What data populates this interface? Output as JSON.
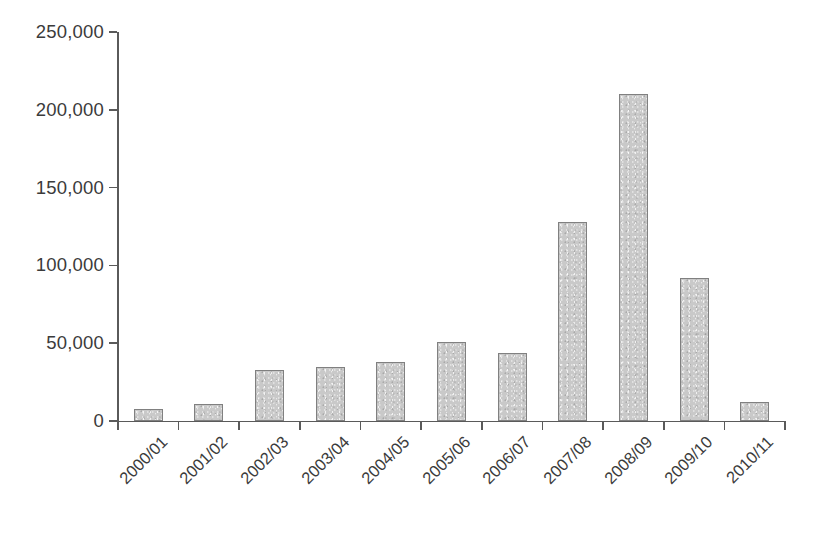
{
  "chart_data": {
    "type": "bar",
    "title": "",
    "subtitle": "",
    "xlabel": "",
    "ylabel": "",
    "categories": [
      "2000/01",
      "2001/02",
      "2002/03",
      "2003/04",
      "2004/05",
      "2005/06",
      "2006/07",
      "2007/08",
      "2008/09",
      "2009/10",
      "2010/11"
    ],
    "values": [
      8000,
      11000,
      33000,
      35000,
      38000,
      51000,
      44000,
      128000,
      210000,
      92000,
      12000
    ],
    "ylim": [
      0,
      250000
    ],
    "ytick_values": [
      0,
      50000,
      100000,
      150000,
      200000,
      250000
    ],
    "ytick_labels": [
      "0",
      "50,000",
      "100,000",
      "150,000",
      "200,000",
      "250,000"
    ],
    "grid": false,
    "legend": false,
    "legend_position": "none",
    "xtick_rotation_degrees": -45,
    "series": [
      {
        "name": "",
        "values": [
          8000,
          11000,
          33000,
          35000,
          38000,
          51000,
          44000,
          128000,
          210000,
          92000,
          12000
        ]
      }
    ]
  },
  "style": {
    "bar_fill": "#c9c9c9",
    "bar_border": "#808080",
    "axis_color": "#5a5a5a",
    "text_color": "#3b3b3b",
    "background": "#ffffff"
  }
}
